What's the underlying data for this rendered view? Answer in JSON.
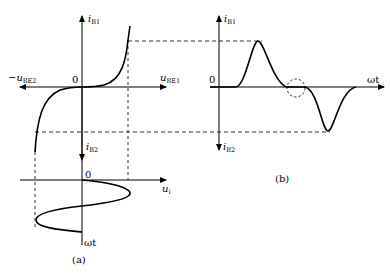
{
  "figure": {
    "panel_a": {
      "caption": "(a)",
      "origin_label": "0",
      "y_up_label": {
        "main": "i",
        "sub": "B1"
      },
      "y_down_label": {
        "main": "i",
        "sub": "B2"
      },
      "x_right_label": {
        "main": "u",
        "sub": "BE1"
      },
      "x_left_label": {
        "main": "−u",
        "sub": "BE2"
      },
      "input": {
        "origin_label": "0",
        "x_label": {
          "main": "u",
          "sub": "i"
        },
        "time_axis_label": "ωt"
      }
    },
    "panel_b": {
      "caption": "(b)",
      "origin_label": "0",
      "y_up_label": {
        "main": "i",
        "sub": "B1"
      },
      "y_down_label": {
        "main": "i",
        "sub": "B2"
      },
      "time_axis_label": "ωt",
      "annotation": "crossover distortion region (dashed circle)"
    }
  }
}
